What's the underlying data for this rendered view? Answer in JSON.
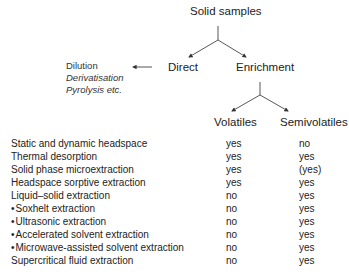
{
  "diagram": {
    "root": "Solid samples",
    "branches": {
      "direct": "Direct",
      "enrichment": "Enrichment"
    },
    "direct_methods": [
      "Dilution",
      "Derivatisation",
      "Pyrolysis etc."
    ],
    "enrichment_children": {
      "volatiles": "Volatiles",
      "semivolatiles": "Semivolatiles"
    }
  },
  "table": {
    "columns": [
      "Volatiles",
      "Semivolatiles"
    ],
    "rows": [
      {
        "method": "Static and dynamic headspace",
        "bullet": false,
        "volatiles": "yes",
        "semivolatiles": "no"
      },
      {
        "method": "Thermal desorption",
        "bullet": false,
        "volatiles": "yes",
        "semivolatiles": "yes"
      },
      {
        "method": "Solid phase microextraction",
        "bullet": false,
        "volatiles": "yes",
        "semivolatiles": "(yes)"
      },
      {
        "method": "Headspace sorptive extraction",
        "bullet": false,
        "volatiles": "yes",
        "semivolatiles": "yes"
      },
      {
        "method": "Liquid–solid extraction",
        "bullet": false,
        "volatiles": "no",
        "semivolatiles": "yes"
      },
      {
        "method": "Soxhelt extraction",
        "bullet": true,
        "volatiles": "no",
        "semivolatiles": "yes"
      },
      {
        "method": "Ultrasonic extraction",
        "bullet": true,
        "volatiles": "no",
        "semivolatiles": "yes"
      },
      {
        "method": "Accelerated solvent extraction",
        "bullet": true,
        "volatiles": "no",
        "semivolatiles": "yes"
      },
      {
        "method": "Microwave-assisted solvent extraction",
        "bullet": true,
        "volatiles": "no",
        "semivolatiles": "yes"
      },
      {
        "method": "Supercritical fluid extraction",
        "bullet": false,
        "volatiles": "no",
        "semivolatiles": "yes"
      }
    ]
  }
}
